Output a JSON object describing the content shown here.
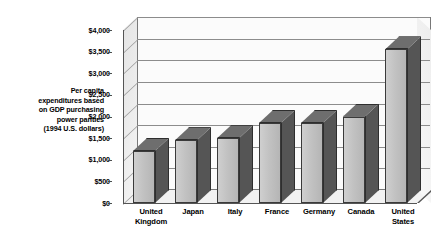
{
  "chart_data": {
    "type": "bar",
    "title": "",
    "subtitle": "",
    "xlabel": "",
    "ylabel": "Per capita expenditures based on GDP purchasing power parities (1994 U.S. dollars)",
    "ylabel_lines": [
      "Per capita",
      "expenditures based",
      "on GDP purchasing",
      "power parities",
      "(1994 U.S. dollars)"
    ],
    "categories": [
      "United Kingdom",
      "Japan",
      "Italy",
      "France",
      "Germany",
      "Canada",
      "United States"
    ],
    "category_lines": [
      [
        "United",
        "Kingdom"
      ],
      [
        "Japan",
        ""
      ],
      [
        "Italy",
        ""
      ],
      [
        "France",
        ""
      ],
      [
        "Germany",
        ""
      ],
      [
        "Canada",
        ""
      ],
      [
        "United",
        "States"
      ]
    ],
    "values": [
      1200,
      1450,
      1500,
      1850,
      1850,
      2000,
      3550
    ],
    "ylim": [
      0,
      4000
    ],
    "ytick_step": 500,
    "yticks": [
      0,
      500,
      1000,
      1500,
      2000,
      2500,
      3000,
      3500,
      4000
    ],
    "ytick_labels": [
      "$0",
      "$500",
      "$1,000",
      "$1,500",
      "$2,000",
      "$2,500",
      "$3,000",
      "$3,500",
      "$4,000"
    ],
    "grid": true,
    "legend": null,
    "style": "3d-column",
    "colors": {
      "bar_front": "#c2c2c2",
      "bar_side": "#555555",
      "bar_top": "#6e6e6e",
      "bar_outline": "#3a3a3a",
      "plot_background": "#fbfbfb",
      "wall": "#efefef",
      "gridline": "#8c8c8c",
      "axis": "#555555",
      "text": "#000000"
    }
  }
}
